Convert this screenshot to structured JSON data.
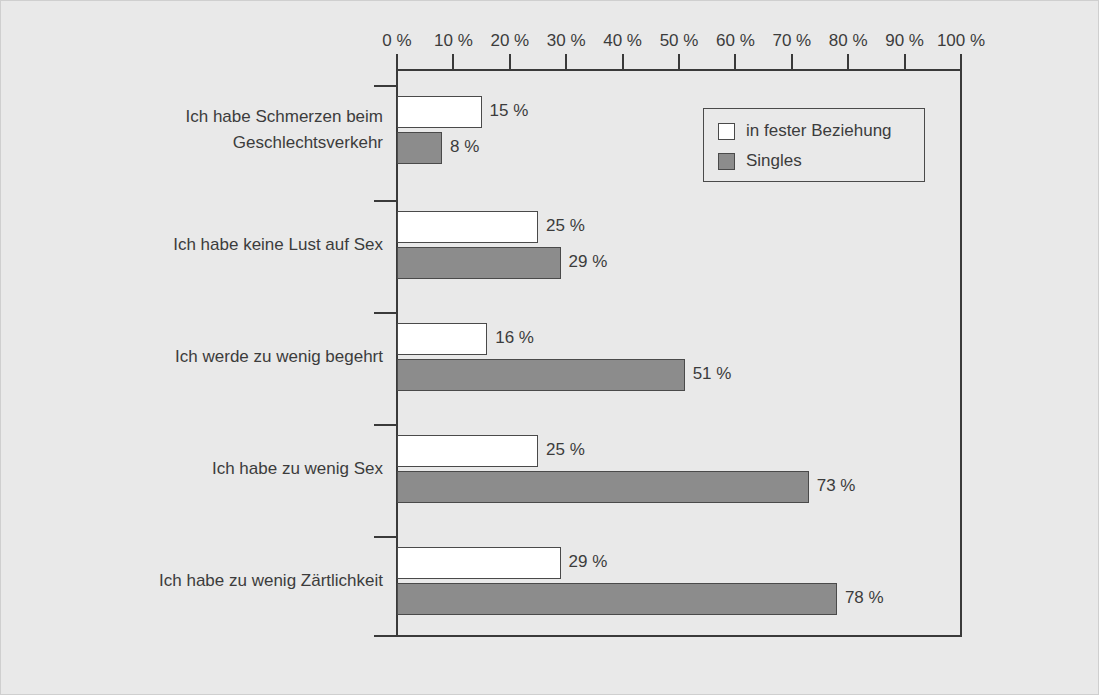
{
  "chart_data": {
    "type": "bar",
    "orientation": "horizontal",
    "title": "",
    "xlabel": "",
    "ylabel": "",
    "xlim": [
      0,
      100
    ],
    "grid": false,
    "legend_position": "top-right-inside",
    "tick_labels": [
      "0 %",
      "10 %",
      "20 %",
      "30 %",
      "40 %",
      "50 %",
      "60 %",
      "70 %",
      "80 %",
      "90 %",
      "100 %"
    ],
    "tick_values": [
      0,
      10,
      20,
      30,
      40,
      50,
      60,
      70,
      80,
      90,
      100
    ],
    "categories": [
      "Ich habe Schmerzen beim\nGeschlechtsverkehr",
      "Ich habe keine Lust auf Sex",
      "Ich werde zu wenig begehrt",
      "Ich habe zu wenig Sex",
      "Ich habe zu wenig Zärtlichkeit"
    ],
    "series": [
      {
        "name": "in fester Beziehung",
        "color": "#ffffff",
        "values": [
          15,
          25,
          16,
          25,
          29
        ],
        "labels": [
          "15 %",
          "25 %",
          "16 %",
          "25 %",
          "29 %"
        ]
      },
      {
        "name": "Singles",
        "color": "#8c8c8c",
        "values": [
          8,
          29,
          51,
          73,
          78
        ],
        "labels": [
          "8 %",
          "29 %",
          "51 %",
          "73 %",
          "78 %"
        ]
      }
    ]
  },
  "legend": {
    "items": [
      {
        "label": "in fester Beziehung",
        "swatch": "white"
      },
      {
        "label": "Singles",
        "swatch": "gray"
      }
    ]
  },
  "colors": {
    "background": "#e9e9e9",
    "axis": "#3a3a3a",
    "text": "#3c3c3c",
    "bar_white": "#ffffff",
    "bar_gray": "#8c8c8c",
    "bar_outline": "#4a4a4a"
  }
}
